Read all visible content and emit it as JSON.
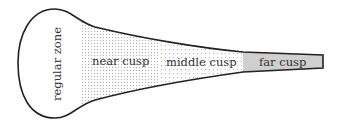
{
  "diagram": {
    "regions": [
      {
        "id": "regular",
        "label": "regular zone",
        "fill": "#ffffff",
        "pattern": "none"
      },
      {
        "id": "near",
        "label": "near cusp",
        "fill": "#ffffff",
        "pattern": "dense-dots"
      },
      {
        "id": "middle",
        "label": "middle cusp",
        "fill": "#ffffff",
        "pattern": "sparse-dots"
      },
      {
        "id": "far",
        "label": "far cusp",
        "fill": "#cfcfcf",
        "pattern": "none"
      }
    ],
    "outline_color": "#222222"
  }
}
